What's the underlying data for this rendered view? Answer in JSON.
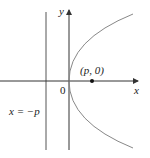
{
  "diagram": {
    "axes": {
      "x_label": "x",
      "y_label": "y",
      "origin_label": "0"
    },
    "focus": {
      "label": "(p, 0)"
    },
    "directrix": {
      "label": "x = −p"
    },
    "colors": {
      "curve": "#888888",
      "axis": "#333333",
      "line": "#555555"
    }
  }
}
